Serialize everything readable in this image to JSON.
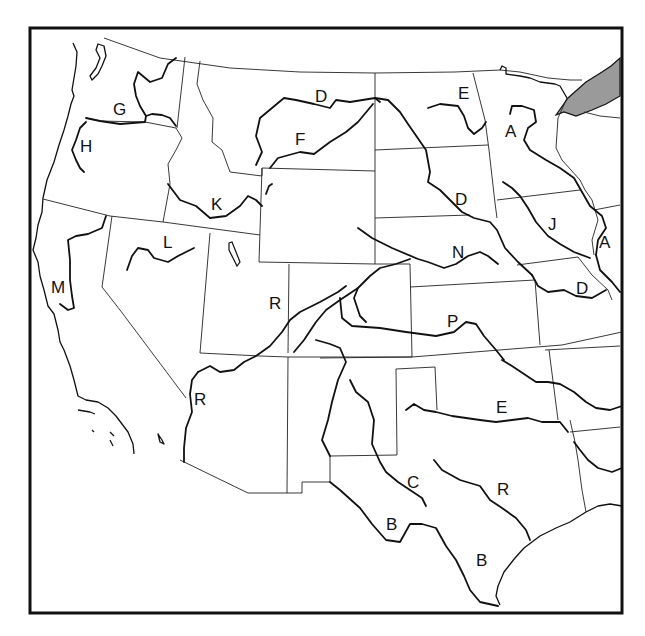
{
  "map": {
    "title": "Rivers of the Western United States",
    "colors": {
      "ink": "#111111",
      "background": "#ffffff",
      "lake_fill": "#9a9a9a"
    },
    "labels": [
      {
        "id": "G",
        "text": "G",
        "x": 113,
        "y": 115
      },
      {
        "id": "H",
        "text": "H",
        "x": 80,
        "y": 152
      },
      {
        "id": "D1",
        "text": "D",
        "x": 315,
        "y": 102
      },
      {
        "id": "E1",
        "text": "E",
        "x": 458,
        "y": 99
      },
      {
        "id": "F",
        "text": "F",
        "x": 295,
        "y": 145
      },
      {
        "id": "A1",
        "text": "A",
        "x": 505,
        "y": 137
      },
      {
        "id": "K",
        "text": "K",
        "x": 211,
        "y": 210
      },
      {
        "id": "D2",
        "text": "D",
        "x": 455,
        "y": 205
      },
      {
        "id": "J",
        "text": "J",
        "x": 548,
        "y": 230
      },
      {
        "id": "A2",
        "text": "A",
        "x": 599,
        "y": 248
      },
      {
        "id": "L",
        "text": "L",
        "x": 163,
        "y": 248
      },
      {
        "id": "N",
        "text": "N",
        "x": 452,
        "y": 258
      },
      {
        "id": "M",
        "text": "M",
        "x": 51,
        "y": 293
      },
      {
        "id": "R1",
        "text": "R",
        "x": 269,
        "y": 309
      },
      {
        "id": "D3",
        "text": "D",
        "x": 576,
        "y": 294
      },
      {
        "id": "P",
        "text": "P",
        "x": 447,
        "y": 327
      },
      {
        "id": "R2",
        "text": "R",
        "x": 194,
        "y": 405
      },
      {
        "id": "E2",
        "text": "E",
        "x": 496,
        "y": 413
      },
      {
        "id": "C",
        "text": "C",
        "x": 407,
        "y": 488
      },
      {
        "id": "R3",
        "text": "R",
        "x": 497,
        "y": 495
      },
      {
        "id": "B1",
        "text": "B",
        "x": 386,
        "y": 530
      },
      {
        "id": "B2",
        "text": "B",
        "x": 476,
        "y": 566
      }
    ]
  }
}
